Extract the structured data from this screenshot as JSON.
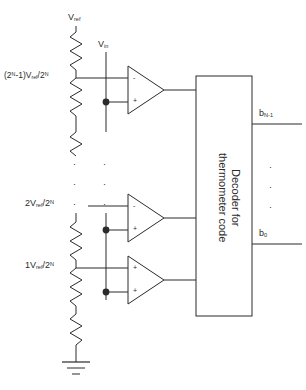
{
  "diagram": {
    "ink_color": "#2b2b2b",
    "background": "#ffffff"
  },
  "supply": {
    "vref_label": "V",
    "vref_sub": "ref",
    "vin_label": "V",
    "vin_sub": "in"
  },
  "ladder": {
    "taps": [
      {
        "prefix": "(2",
        "sup1": "N",
        "mid": "-1)V",
        "sub": "ref",
        "slash": "/2",
        "sup2": "N"
      },
      {
        "prefix": "2V",
        "sub": "ref",
        "slash": "/2",
        "sup2": "N"
      },
      {
        "prefix": "1V",
        "sub": "ref",
        "slash": "/2",
        "sup2": "N"
      }
    ],
    "ground_name": "ground"
  },
  "comparators": {
    "minus_sign": "-",
    "plus_sign": "+",
    "count": 3
  },
  "decoder": {
    "text": "Decoder for\nthermometer code"
  },
  "outputs": [
    {
      "name": "b",
      "sub": "N-1"
    },
    {
      "name": "b",
      "sub": "0"
    }
  ],
  "ellipsis": {
    "dot": "·",
    "rows": 3
  }
}
